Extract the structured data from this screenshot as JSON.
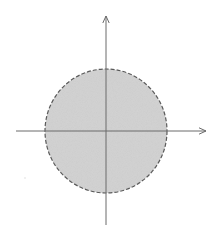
{
  "diagram": {
    "type": "disk-on-coordinate-axes",
    "colors": {
      "background": "#ffffff",
      "disk_fill": "#d4d4d4",
      "disk_stroke": "#5a5a5a",
      "axis": "#6a6a6a"
    },
    "axes": {
      "origin": [
        106,
        131
      ],
      "x_axis": {
        "from": [
          16,
          131
        ],
        "to": [
          206,
          131
        ],
        "arrow": true
      },
      "y_axis": {
        "from": [
          106,
          225
        ],
        "to": [
          106,
          16
        ],
        "arrow": true
      }
    },
    "disk": {
      "center": [
        106,
        131
      ],
      "rx": 61,
      "ry": 62,
      "boundary_style": "dashed",
      "fill_style": "stippled-gray"
    }
  }
}
